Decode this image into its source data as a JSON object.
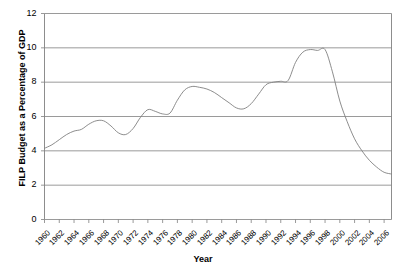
{
  "chart_data": {
    "type": "line",
    "title": "",
    "xlabel": "Year",
    "ylabel": "FILP Budget as a Percentage of GDP",
    "xlim": [
      1960,
      2007
    ],
    "ylim": [
      0,
      12
    ],
    "ytick_labels": [
      "0",
      "2",
      "4",
      "6",
      "8",
      "10",
      "12"
    ],
    "yticks": [
      0,
      2,
      4,
      6,
      8,
      10,
      12
    ],
    "xtick_labels": [
      "1960",
      "1962",
      "1964",
      "1966",
      "1968",
      "1970",
      "1972",
      "1974",
      "1976",
      "1978",
      "1980",
      "1982",
      "1984",
      "1986",
      "1988",
      "1990",
      "1992",
      "1994",
      "1996",
      "1998",
      "2000",
      "2002",
      "2004",
      "2006"
    ],
    "xticks": [
      1960,
      1962,
      1964,
      1966,
      1968,
      1970,
      1972,
      1974,
      1976,
      1978,
      1980,
      1982,
      1984,
      1986,
      1988,
      1990,
      1992,
      1994,
      1996,
      1998,
      2000,
      2002,
      2004,
      2006
    ],
    "grid": "horizontal",
    "legend": "none",
    "line_color": "#808080",
    "border_color": "#808080",
    "series": [
      {
        "name": "FILP Budget as a Percentage of GDP",
        "x": [
          1960,
          1961,
          1962,
          1963,
          1964,
          1965,
          1966,
          1967,
          1968,
          1969,
          1970,
          1971,
          1972,
          1973,
          1974,
          1975,
          1976,
          1977,
          1978,
          1979,
          1980,
          1981,
          1982,
          1983,
          1984,
          1985,
          1986,
          1987,
          1988,
          1989,
          1990,
          1991,
          1992,
          1993,
          1994,
          1995,
          1996,
          1997,
          1998,
          1999,
          2000,
          2001,
          2002,
          2003,
          2004,
          2005,
          2006,
          2007
        ],
        "values": [
          4.15,
          4.35,
          4.65,
          4.95,
          5.15,
          5.25,
          5.55,
          5.75,
          5.75,
          5.45,
          5.05,
          4.95,
          5.3,
          5.95,
          6.4,
          6.3,
          6.15,
          6.2,
          6.95,
          7.55,
          7.75,
          7.7,
          7.6,
          7.4,
          7.1,
          6.8,
          6.5,
          6.45,
          6.75,
          7.3,
          7.85,
          8.0,
          8.05,
          8.1,
          9.15,
          9.75,
          9.9,
          9.85,
          9.9,
          8.6,
          6.9,
          5.7,
          4.7,
          4.0,
          3.45,
          3.05,
          2.75,
          2.65
        ]
      }
    ]
  },
  "axes": {
    "ylabel_text": "FILP Budget as a Percentage of GDP",
    "xlabel_text": "Year"
  }
}
